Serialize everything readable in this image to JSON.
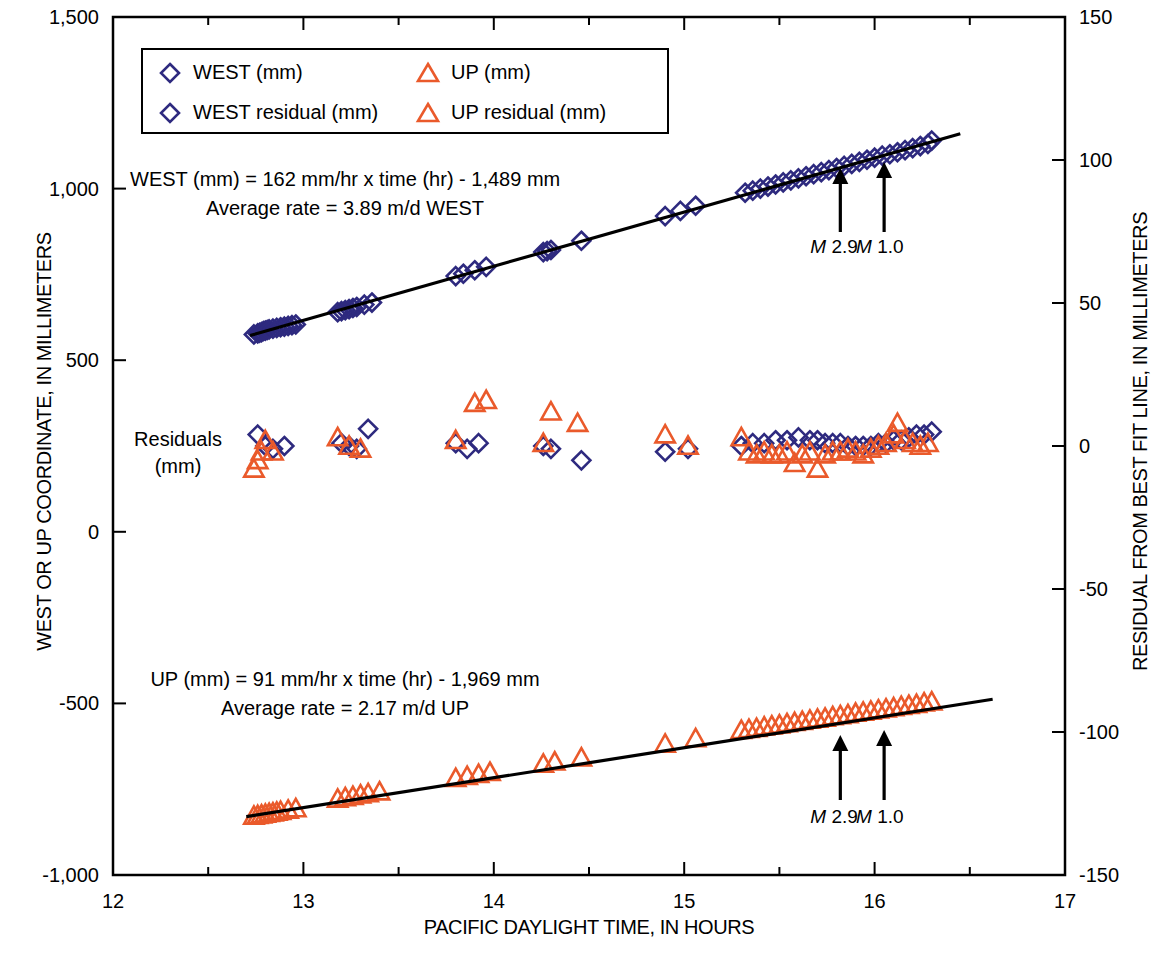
{
  "chart_data": {
    "type": "scatter",
    "title": "",
    "xlabel": "PACIFIC DAYLIGHT TIME, IN HOURS",
    "ylabel": "WEST OR UP COORDINATE, IN MILLIMETERS",
    "ylabel_right": "RESIDUAL FROM BEST FIT LINE, IN MILLIMETERS",
    "xlim": [
      12,
      17
    ],
    "ylim": [
      -1000,
      1500
    ],
    "ylim_right": [
      -150,
      150
    ],
    "xticks": [
      12,
      13,
      14,
      15,
      16,
      17
    ],
    "xticklabels": [
      "12",
      "13",
      "14",
      "15",
      "16",
      "17"
    ],
    "xminorticks": [
      12.5,
      13.5,
      14.5,
      15.5,
      16.5
    ],
    "yticks": [
      -1000,
      -500,
      0,
      500,
      1000,
      1500
    ],
    "yticklabels": [
      "-1,000",
      "-500",
      "0",
      "500",
      "1,000",
      "1,500"
    ],
    "yticks_right": [
      -150,
      -100,
      -50,
      0,
      50,
      100,
      150
    ],
    "yticklabels_right": [
      "-150",
      "-100",
      "-50",
      "0",
      "50",
      "100",
      "150"
    ],
    "grid": false,
    "legend_position": "upper-left",
    "series": [
      {
        "name": "WEST (mm)",
        "marker": "diamond",
        "color": "#2e2a7f",
        "axis": "left",
        "points": [
          [
            12.74,
            575
          ],
          [
            12.76,
            578
          ],
          [
            12.77,
            580
          ],
          [
            12.78,
            582
          ],
          [
            12.79,
            585
          ],
          [
            12.8,
            586
          ],
          [
            12.81,
            588
          ],
          [
            12.82,
            590
          ],
          [
            12.84,
            592
          ],
          [
            12.86,
            594
          ],
          [
            12.88,
            596
          ],
          [
            12.9,
            598
          ],
          [
            12.92,
            600
          ],
          [
            12.94,
            602
          ],
          [
            12.96,
            604
          ],
          [
            13.18,
            640
          ],
          [
            13.2,
            643
          ],
          [
            13.22,
            646
          ],
          [
            13.24,
            649
          ],
          [
            13.26,
            652
          ],
          [
            13.28,
            655
          ],
          [
            13.32,
            662
          ],
          [
            13.36,
            668
          ],
          [
            13.8,
            745
          ],
          [
            13.84,
            752
          ],
          [
            13.9,
            762
          ],
          [
            13.96,
            772
          ],
          [
            14.26,
            815
          ],
          [
            14.28,
            818
          ],
          [
            14.3,
            821
          ],
          [
            14.46,
            848
          ],
          [
            14.9,
            920
          ],
          [
            14.98,
            935
          ],
          [
            15.06,
            950
          ],
          [
            15.32,
            988
          ],
          [
            15.36,
            994
          ],
          [
            15.4,
            1000
          ],
          [
            15.44,
            1006
          ],
          [
            15.48,
            1012
          ],
          [
            15.52,
            1018
          ],
          [
            15.56,
            1024
          ],
          [
            15.6,
            1030
          ],
          [
            15.64,
            1036
          ],
          [
            15.68,
            1042
          ],
          [
            15.72,
            1048
          ],
          [
            15.76,
            1054
          ],
          [
            15.8,
            1060
          ],
          [
            15.84,
            1066
          ],
          [
            15.88,
            1072
          ],
          [
            15.92,
            1078
          ],
          [
            15.96,
            1084
          ],
          [
            16.0,
            1090
          ],
          [
            16.04,
            1096
          ],
          [
            16.08,
            1100
          ],
          [
            16.12,
            1106
          ],
          [
            16.16,
            1112
          ],
          [
            16.2,
            1118
          ],
          [
            16.24,
            1124
          ],
          [
            16.28,
            1130
          ],
          [
            16.3,
            1140
          ]
        ]
      },
      {
        "name": "UP (mm)",
        "marker": "triangle",
        "color": "#ea5a2b",
        "axis": "left",
        "points": [
          [
            12.74,
            -828
          ],
          [
            12.76,
            -826
          ],
          [
            12.78,
            -824
          ],
          [
            12.8,
            -822
          ],
          [
            12.82,
            -820
          ],
          [
            12.84,
            -818
          ],
          [
            12.86,
            -816
          ],
          [
            12.88,
            -814
          ],
          [
            12.92,
            -810
          ],
          [
            12.96,
            -806
          ],
          [
            13.18,
            -778
          ],
          [
            13.22,
            -774
          ],
          [
            13.26,
            -770
          ],
          [
            13.3,
            -766
          ],
          [
            13.34,
            -762
          ],
          [
            13.4,
            -757
          ],
          [
            13.8,
            -718
          ],
          [
            13.86,
            -712
          ],
          [
            13.92,
            -706
          ],
          [
            13.98,
            -700
          ],
          [
            14.26,
            -676
          ],
          [
            14.32,
            -670
          ],
          [
            14.46,
            -658
          ],
          [
            14.9,
            -618
          ],
          [
            15.06,
            -602
          ],
          [
            15.3,
            -578
          ],
          [
            15.34,
            -575
          ],
          [
            15.38,
            -572
          ],
          [
            15.42,
            -568
          ],
          [
            15.46,
            -565
          ],
          [
            15.5,
            -562
          ],
          [
            15.54,
            -558
          ],
          [
            15.58,
            -555
          ],
          [
            15.62,
            -552
          ],
          [
            15.66,
            -548
          ],
          [
            15.7,
            -545
          ],
          [
            15.74,
            -542
          ],
          [
            15.78,
            -538
          ],
          [
            15.82,
            -535
          ],
          [
            15.86,
            -532
          ],
          [
            15.9,
            -528
          ],
          [
            15.94,
            -525
          ],
          [
            15.98,
            -522
          ],
          [
            16.02,
            -518
          ],
          [
            16.06,
            -515
          ],
          [
            16.1,
            -512
          ],
          [
            16.14,
            -508
          ],
          [
            16.18,
            -505
          ],
          [
            16.22,
            -502
          ],
          [
            16.26,
            -498
          ],
          [
            16.3,
            -495
          ]
        ]
      },
      {
        "name": "WEST residual (mm)",
        "marker": "diamond",
        "color": "#2e2a7f",
        "axis": "right",
        "points": [
          [
            12.76,
            4
          ],
          [
            12.8,
            0
          ],
          [
            12.84,
            -1
          ],
          [
            12.9,
            0
          ],
          [
            13.2,
            1
          ],
          [
            13.24,
            0
          ],
          [
            13.28,
            -1
          ],
          [
            13.34,
            6
          ],
          [
            13.8,
            1
          ],
          [
            13.86,
            -1
          ],
          [
            13.92,
            1
          ],
          [
            14.26,
            0
          ],
          [
            14.3,
            -1
          ],
          [
            14.46,
            -5
          ],
          [
            14.9,
            -2
          ],
          [
            15.02,
            -1
          ],
          [
            15.3,
            0
          ],
          [
            15.36,
            1
          ],
          [
            15.42,
            1
          ],
          [
            15.48,
            2
          ],
          [
            15.54,
            2
          ],
          [
            15.6,
            3
          ],
          [
            15.66,
            2
          ],
          [
            15.7,
            2
          ],
          [
            15.74,
            1
          ],
          [
            15.78,
            1
          ],
          [
            15.82,
            1
          ],
          [
            15.86,
            0
          ],
          [
            15.9,
            0
          ],
          [
            15.94,
            0
          ],
          [
            15.98,
            0
          ],
          [
            16.02,
            1
          ],
          [
            16.06,
            1
          ],
          [
            16.1,
            2
          ],
          [
            16.14,
            2
          ],
          [
            16.18,
            3
          ],
          [
            16.22,
            4
          ],
          [
            16.26,
            4
          ],
          [
            16.3,
            5
          ]
        ]
      },
      {
        "name": "UP residual (mm)",
        "marker": "triangle",
        "color": "#ea5a2b",
        "axis": "right",
        "points": [
          [
            12.74,
            -8
          ],
          [
            12.76,
            -5
          ],
          [
            12.78,
            -2
          ],
          [
            12.8,
            2
          ],
          [
            12.84,
            -2
          ],
          [
            13.18,
            3
          ],
          [
            13.24,
            0
          ],
          [
            13.3,
            -1
          ],
          [
            13.8,
            2
          ],
          [
            13.9,
            15
          ],
          [
            13.96,
            16
          ],
          [
            14.26,
            1
          ],
          [
            14.3,
            12
          ],
          [
            14.44,
            8
          ],
          [
            14.9,
            4
          ],
          [
            15.02,
            0
          ],
          [
            15.3,
            3
          ],
          [
            15.34,
            -2
          ],
          [
            15.38,
            -3
          ],
          [
            15.42,
            -2
          ],
          [
            15.46,
            -3
          ],
          [
            15.5,
            -3
          ],
          [
            15.54,
            -2
          ],
          [
            15.58,
            -6
          ],
          [
            15.62,
            -3
          ],
          [
            15.66,
            -2
          ],
          [
            15.7,
            -8
          ],
          [
            15.74,
            -3
          ],
          [
            15.78,
            -2
          ],
          [
            15.82,
            -2
          ],
          [
            15.86,
            -1
          ],
          [
            15.9,
            -2
          ],
          [
            15.94,
            -3
          ],
          [
            15.98,
            -1
          ],
          [
            16.02,
            0
          ],
          [
            16.06,
            1
          ],
          [
            16.1,
            4
          ],
          [
            16.12,
            8
          ],
          [
            16.16,
            2
          ],
          [
            16.2,
            1
          ],
          [
            16.24,
            0
          ],
          [
            16.28,
            1
          ]
        ]
      }
    ],
    "fit_lines": [
      {
        "name": "WEST best fit",
        "color": "#000000",
        "x": [
          12.72,
          16.45
        ],
        "y": [
          572,
          1160
        ],
        "equation": "WEST (mm) = 162 mm/hr x time (hr) - 1,489 mm",
        "slope": 162,
        "intercept": -1489
      },
      {
        "name": "UP best fit",
        "color": "#000000",
        "x": [
          12.7,
          16.62
        ],
        "y": [
          -830,
          -488
        ],
        "equation": "UP (mm) = 91 mm/hr x time (hr) - 1,969 mm",
        "slope": 91,
        "intercept": -1969
      }
    ],
    "annotations": [
      {
        "text": "M 2.9",
        "x": 15.82,
        "label_y": 248,
        "group": "west"
      },
      {
        "text": "M 1.0",
        "x": 16.05,
        "label_y": 248,
        "group": "west"
      },
      {
        "text": "M 2.9",
        "x": 15.82,
        "label_y": 821,
        "group": "up"
      },
      {
        "text": "M 1.0",
        "x": 16.05,
        "label_y": 821,
        "group": "up"
      }
    ]
  },
  "legend": {
    "items": [
      {
        "label": "WEST (mm)",
        "marker": "diamond",
        "color": "#2e2a7f"
      },
      {
        "label": "UP (mm)",
        "marker": "triangle",
        "color": "#ea5a2b"
      },
      {
        "label": "WEST residual (mm)",
        "marker": "diamond",
        "color": "#2e2a7f"
      },
      {
        "label": "UP residual (mm)",
        "marker": "triangle",
        "color": "#ea5a2b"
      }
    ]
  },
  "equations": {
    "west_line1": "WEST (mm) = 162 mm/hr x time (hr) - 1,489 mm",
    "west_line2": "Average rate = 3.89 m/d WEST",
    "up_line1": "UP (mm) = 91 mm/hr x time (hr) - 1,969 mm",
    "up_line2": "Average rate = 2.17 m/d UP"
  },
  "residual_label": {
    "line1": "Residuals",
    "line2": "(mm)"
  },
  "magnitude_labels": {
    "m29_prefix": "M",
    "m29_value": "2.9",
    "m10_prefix": "M",
    "m10_value": "1.0"
  },
  "axes": {
    "x_title": "PACIFIC DAYLIGHT TIME, IN HOURS",
    "y_left_title": "WEST OR UP COORDINATE, IN MILLIMETERS",
    "y_right_title": "RESIDUAL FROM BEST FIT LINE, IN MILLIMETERS"
  }
}
